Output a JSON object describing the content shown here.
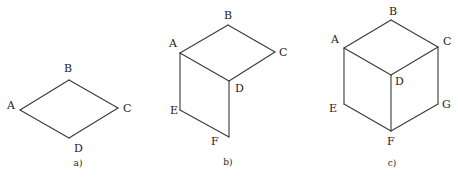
{
  "figures": [
    {
      "id": "a",
      "caption": "a)",
      "shape": "rhombus (top face)",
      "vertices": [
        "A",
        "B",
        "C",
        "D"
      ],
      "edges": [
        [
          "A",
          "B"
        ],
        [
          "B",
          "C"
        ],
        [
          "C",
          "D"
        ],
        [
          "D",
          "A"
        ]
      ]
    },
    {
      "id": "b",
      "caption": "b)",
      "shape": "top face and left face of cube",
      "vertices": [
        "A",
        "B",
        "C",
        "D",
        "E",
        "F"
      ],
      "edges": [
        [
          "A",
          "B"
        ],
        [
          "B",
          "C"
        ],
        [
          "C",
          "D"
        ],
        [
          "D",
          "A"
        ],
        [
          "A",
          "E"
        ],
        [
          "E",
          "F"
        ],
        [
          "F",
          "D"
        ]
      ]
    },
    {
      "id": "c",
      "caption": "c)",
      "shape": "cube (three visible faces)",
      "vertices": [
        "A",
        "B",
        "C",
        "D",
        "E",
        "F",
        "G"
      ],
      "edges": [
        [
          "A",
          "B"
        ],
        [
          "B",
          "C"
        ],
        [
          "C",
          "D"
        ],
        [
          "D",
          "A"
        ],
        [
          "A",
          "E"
        ],
        [
          "E",
          "F"
        ],
        [
          "F",
          "D"
        ],
        [
          "C",
          "G"
        ],
        [
          "G",
          "F"
        ]
      ]
    }
  ],
  "colors": {
    "line": "#3a3a3a",
    "text": "#222222",
    "background": "#ffffff"
  }
}
